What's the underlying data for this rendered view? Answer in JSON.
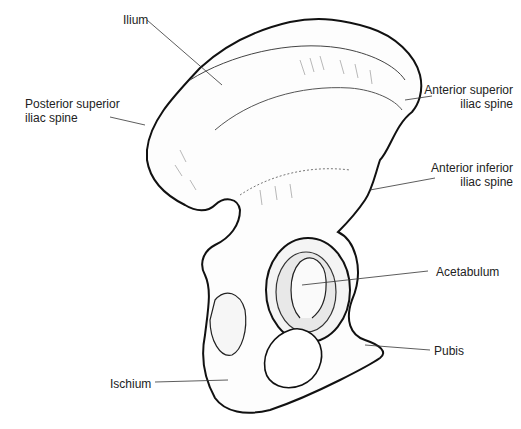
{
  "figure": {
    "labels": [
      {
        "id": "ilium",
        "text": [
          "Ilium"
        ]
      },
      {
        "id": "posterior-superior-iliac-spine",
        "text": [
          "Posterior superior",
          "iliac spine"
        ]
      },
      {
        "id": "anterior-superior-iliac-spine",
        "text": [
          "Anterior superior",
          "iliac spine"
        ]
      },
      {
        "id": "anterior-inferior-iliac-spine",
        "text": [
          "Anterior inferior",
          "iliac spine"
        ]
      },
      {
        "id": "acetabulum",
        "text": [
          "Acetabulum"
        ]
      },
      {
        "id": "pubis",
        "text": [
          "Pubis"
        ]
      },
      {
        "id": "ischium",
        "text": [
          "Ischium"
        ]
      }
    ]
  },
  "colors": {
    "outline": "#111111",
    "shading": "#555555",
    "background": "#ffffff",
    "text": "#222222"
  }
}
